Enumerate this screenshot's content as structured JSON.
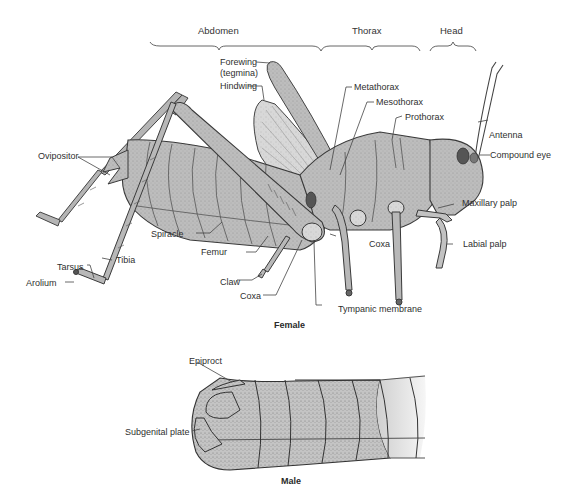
{
  "figure": {
    "region_labels": {
      "abdomen": "Abdomen",
      "thorax": "Thorax",
      "head": "Head"
    },
    "female": {
      "caption": "Female",
      "labels": {
        "forewing": "Forewing",
        "forewing_alt": "(tegmina)",
        "hindwing": "Hindwing",
        "metathorax": "Metathorax",
        "mesothorax": "Mesothorax",
        "prothorax": "Prothorax",
        "antenna": "Antenna",
        "compound_eye": "Compound eye",
        "ovipositor": "Ovipositor",
        "maxillary_palp": "Maxillary palp",
        "labial_palp": "Labial palp",
        "spiracle": "Spiracle",
        "femur": "Femur",
        "coxa_front": "Coxa",
        "tibia": "Tibia",
        "tarsus": "Tarsus",
        "arolium": "Arolium",
        "claw": "Claw",
        "coxa_hind": "Coxa",
        "tympanic_membrane": "Tympanic membrane"
      }
    },
    "male": {
      "caption": "Male",
      "labels": {
        "epiproct": "Epiproct",
        "subgenital_plate": "Subgenital plate"
      }
    },
    "colors": {
      "ink": "#3a3a3a",
      "body_fill": "#b9b9b9",
      "body_light": "#cfcfcf",
      "wing_fill": "#dedede",
      "dark_spot": "#555555",
      "background": "#ffffff"
    }
  }
}
